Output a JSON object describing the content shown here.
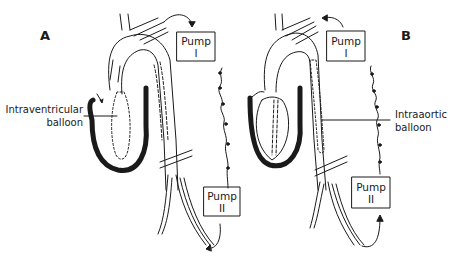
{
  "figure": {
    "panels": [
      {
        "id": "A",
        "letter": "A",
        "callout_line1": "Intraventricular",
        "callout_line2": "balloon",
        "pump1": {
          "line1": "Pump",
          "line2": "I"
        },
        "pump2": {
          "line1": "Pump",
          "line2": "II"
        }
      },
      {
        "id": "B",
        "letter": "B",
        "callout_line1": "Intraaortic",
        "callout_line2": "balloon",
        "pump1": {
          "line1": "Pump",
          "line2": "I"
        },
        "pump2": {
          "line1": "Pump",
          "line2": "II"
        }
      }
    ],
    "colors": {
      "ink": "#1a1a1a",
      "background": "#ffffff"
    }
  }
}
